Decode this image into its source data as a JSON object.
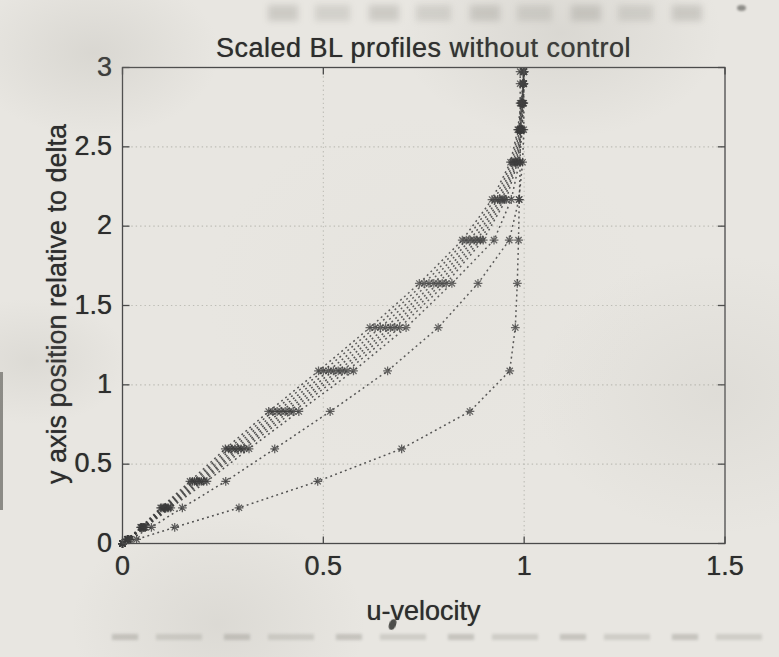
{
  "chart_data": {
    "type": "line",
    "title": "Scaled BL profiles without control",
    "xlabel": "u-velocity",
    "ylabel": "y axis position relative to delta",
    "xlim": [
      0,
      1.5
    ],
    "ylim": [
      0,
      3
    ],
    "xticks": [
      {
        "v": 0,
        "label": "0"
      },
      {
        "v": 0.5,
        "label": "0.5"
      },
      {
        "v": 1,
        "label": "1"
      },
      {
        "v": 1.5,
        "label": "1.5"
      }
    ],
    "yticks": [
      {
        "v": 0,
        "label": "0"
      },
      {
        "v": 0.5,
        "label": "0.5"
      },
      {
        "v": 1,
        "label": "1"
      },
      {
        "v": 1.5,
        "label": "1.5"
      },
      {
        "v": 2,
        "label": "2"
      },
      {
        "v": 2.5,
        "label": "2.5"
      },
      {
        "v": 3,
        "label": "3"
      }
    ],
    "grid": true,
    "line_style": "dotted",
    "marker": "asterisk",
    "legend": "none",
    "y": [
      0,
      0.026,
      0.102,
      0.225,
      0.392,
      0.597,
      0.832,
      1.088,
      1.361,
      1.639,
      1.912,
      2.168,
      2.403,
      2.608,
      2.775,
      2.898,
      2.974
    ],
    "series": [
      {
        "name": "profile-1",
        "u": [
          0,
          0.012,
          0.045,
          0.095,
          0.168,
          0.256,
          0.364,
          0.488,
          0.616,
          0.739,
          0.846,
          0.92,
          0.966,
          0.984,
          0.992,
          0.997,
          0.998
        ]
      },
      {
        "name": "profile-2",
        "u": [
          0,
          0.012,
          0.047,
          0.098,
          0.174,
          0.264,
          0.374,
          0.5,
          0.629,
          0.751,
          0.856,
          0.927,
          0.97,
          0.986,
          0.993,
          0.997,
          0.999
        ]
      },
      {
        "name": "profile-3",
        "u": [
          0,
          0.013,
          0.048,
          0.102,
          0.179,
          0.272,
          0.385,
          0.513,
          0.642,
          0.763,
          0.866,
          0.934,
          0.974,
          0.988,
          0.994,
          0.998,
          0.999
        ]
      },
      {
        "name": "profile-4",
        "u": [
          0,
          0.013,
          0.05,
          0.105,
          0.185,
          0.28,
          0.395,
          0.525,
          0.655,
          0.775,
          0.875,
          0.94,
          0.977,
          0.99,
          0.995,
          0.998,
          0.999
        ]
      },
      {
        "name": "profile-5",
        "u": [
          0,
          0.013,
          0.052,
          0.108,
          0.191,
          0.288,
          0.405,
          0.537,
          0.667,
          0.786,
          0.883,
          0.945,
          0.98,
          0.991,
          0.996,
          0.998,
          0.999
        ]
      },
      {
        "name": "profile-6",
        "u": [
          0,
          0.014,
          0.053,
          0.112,
          0.196,
          0.295,
          0.415,
          0.547,
          0.678,
          0.796,
          0.891,
          0.95,
          0.982,
          0.993,
          0.996,
          0.998,
          0.999
        ]
      },
      {
        "name": "profile-7",
        "u": [
          0,
          0.014,
          0.055,
          0.115,
          0.202,
          0.303,
          0.425,
          0.559,
          0.69,
          0.806,
          0.898,
          0.955,
          0.984,
          0.994,
          0.997,
          0.999,
          0.999
        ]
      },
      {
        "name": "profile-8",
        "u": [
          0,
          0.015,
          0.057,
          0.12,
          0.21,
          0.315,
          0.439,
          0.575,
          0.706,
          0.82,
          0.925,
          0.968,
          0.988,
          0.995,
          0.998,
          0.999,
          0.999
        ]
      },
      {
        "name": "profile-9",
        "u": [
          0,
          0.019,
          0.072,
          0.149,
          0.257,
          0.379,
          0.517,
          0.66,
          0.786,
          0.885,
          0.963,
          0.987,
          0.996,
          0.999,
          0.999,
          0.999,
          0.999
        ]
      },
      {
        "name": "profile-10",
        "u": [
          0,
          0.035,
          0.13,
          0.29,
          0.486,
          0.695,
          0.865,
          0.964,
          0.978,
          0.983,
          0.986,
          0.988,
          0.99,
          0.99,
          0.99,
          0.99,
          0.99
        ]
      }
    ]
  },
  "style": {
    "paper": "#e8e6e1",
    "ink": "#3b3b3b",
    "axis_color": "#4a4a4a",
    "grid_color": "#bdbdb6",
    "text_color": "#2d2d2d"
  }
}
